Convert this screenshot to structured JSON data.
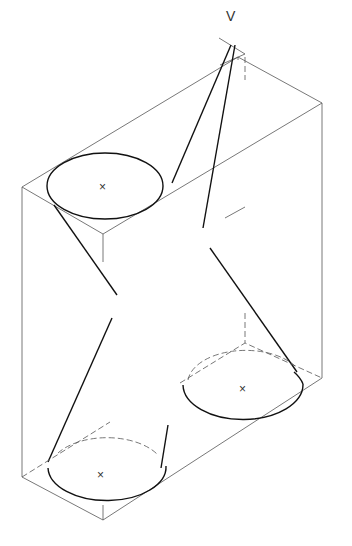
{
  "diagram": {
    "type": "isometric technical drawing",
    "vertex_label": "V",
    "ellipses": [
      {
        "name": "top-left-ellipse",
        "center": [
          103,
          185
        ],
        "center_mark": "×"
      },
      {
        "name": "bottom-right-ellipse",
        "center": [
          245,
          388
        ],
        "center_mark": "×"
      },
      {
        "name": "bottom-left-ellipse",
        "center": [
          103,
          473
        ],
        "center_mark": "×"
      }
    ],
    "colors": {
      "line": "#111111",
      "construction": "#555555",
      "background": "#ffffff"
    }
  }
}
